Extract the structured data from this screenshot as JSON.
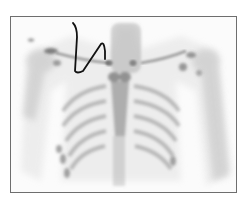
{
  "image": {
    "type": "bone-scintigraphy-anterior-thorax",
    "description": "Grayscale nuclear medicine bone scan of chest with hand-drawn black annotation line near right shoulder/neck",
    "colors": {
      "background": "#ffffff",
      "frame": "#6e6e6e",
      "uptake": "#555555",
      "annotation": "#111111"
    }
  }
}
